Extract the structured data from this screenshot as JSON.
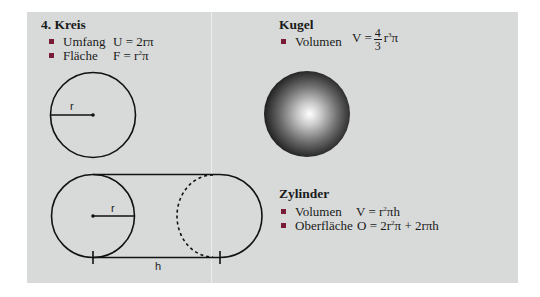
{
  "kreis": {
    "title": "4.  Kreis",
    "items": [
      {
        "label": "Umfang",
        "formula": "U = 2rπ"
      },
      {
        "label": "Fläche",
        "formula_prefix": "F = r",
        "sup": "2",
        "formula_suffix": "π"
      }
    ],
    "radius_label": "r"
  },
  "kugel": {
    "title": "Kugel",
    "items": [
      {
        "label": "Volumen",
        "formula_prefix": "V =",
        "frac_num": "4",
        "frac_den": "3",
        "formula_mid": "r",
        "sup": "3",
        "formula_suffix": "π"
      }
    ]
  },
  "zylinder": {
    "title": "Zylinder",
    "items": [
      {
        "label": "Volumen",
        "formula_prefix": "V = r",
        "sup": "2",
        "formula_suffix": "πh"
      },
      {
        "label": "Oberfläche",
        "formula_prefix": "O = 2r",
        "sup": "2",
        "formula_suffix": "π + 2rπh"
      }
    ],
    "radius_label": "r",
    "height_label": "h"
  },
  "colors": {
    "panel_bg": "#d8dada",
    "bullet": "#7a1c38",
    "stroke": "#111111"
  }
}
